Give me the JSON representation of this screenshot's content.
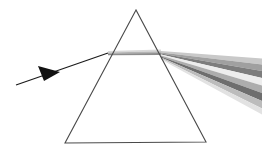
{
  "figure": {
    "background_color": "#ffffff",
    "width": 262,
    "height": 153
  },
  "prism": {
    "label": "triangular prism",
    "outline_color": "#4a4a4a",
    "stroke_width": 1.1,
    "fill": "none",
    "vertices": {
      "apex": {
        "x": 136,
        "y": 10
      },
      "bottom_left": {
        "x": 65,
        "y": 143
      },
      "bottom_right": {
        "x": 206,
        "y": 142
      }
    },
    "points_attr": "136,10 65,143 206,142"
  },
  "incident_ray": {
    "label": "incident white light ray",
    "color": "#1a1a1a",
    "stroke_width": 1.2,
    "start": {
      "x": 16,
      "y": 85
    },
    "end": {
      "x": 108,
      "y": 53
    },
    "path_d": "M 16 85 L 108 53",
    "arrow_head": {
      "label": "direction arrowhead",
      "color": "#111111",
      "points_attr": "38,66 60,72 44,81"
    }
  },
  "internal_beam": {
    "label": "refracted beam inside prism",
    "entry_point": {
      "x": 108,
      "y": 53
    },
    "exit_point": {
      "x": 161,
      "y": 53
    },
    "bands": [
      {
        "name": "internal-band-upper",
        "color": "#d8d8d8",
        "opacity": 1,
        "points_attr": "108,51.0 161,49.4 161,51.2 108,52.4"
      },
      {
        "name": "internal-band-mid",
        "color": "#b4b4b4",
        "opacity": 1,
        "points_attr": "108,52.4 161,51.2 161,53.0 108,53.6"
      },
      {
        "name": "internal-band-lower",
        "color": "#8d8d8d",
        "opacity": 1,
        "points_attr": "108,53.6 161,53.0 161,55.0 108,55.2"
      }
    ]
  },
  "dispersion_fan": {
    "label": "dispersed exit beams",
    "origin": {
      "x": 161,
      "y": 52
    },
    "right_edge_x": 262,
    "spread_top_y": 60,
    "spread_bottom_y": 112,
    "bands": [
      {
        "name": "dispersion-band-1",
        "color": "#c9c9c9",
        "points_attr": "161,51.0 262,58.5 262,64.5 161,52.4"
      },
      {
        "name": "dispersion-band-2",
        "color": "#a0a0a0",
        "points_attr": "161,52.4 262,64.5 262,71.0 161,53.4"
      },
      {
        "name": "dispersion-band-3",
        "color": "#7d7d7d",
        "points_attr": "161,53.4 262,71.0 262,78.0 161,54.4"
      },
      {
        "name": "dispersion-band-4",
        "color": "#ededed",
        "points_attr": "161,54.4 262,78.0 262,85.5 161,55.4"
      },
      {
        "name": "dispersion-band-5",
        "color": "#adadad",
        "points_attr": "161,55.4 262,85.5 262,93.0 161,56.4"
      },
      {
        "name": "dispersion-band-6",
        "color": "#6e6e6e",
        "points_attr": "161,56.4 262,93.0 262,101.0 161,57.6"
      },
      {
        "name": "dispersion-band-7",
        "color": "#bcbcbc",
        "points_attr": "161,57.6 262,101.0 262,108.5 161,58.6"
      },
      {
        "name": "dispersion-band-8",
        "color": "#e2e2e2",
        "points_attr": "161,58.6 262,108.5 262,114.5 161,59.6"
      }
    ]
  }
}
